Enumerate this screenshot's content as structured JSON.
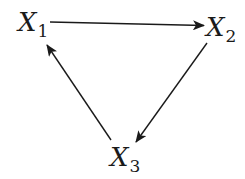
{
  "diagram": {
    "type": "directed-cycle",
    "stroke_color": "#1a1a1a",
    "nodes": [
      {
        "id": "X1",
        "letter": "X",
        "subscript": "1"
      },
      {
        "id": "X2",
        "letter": "X",
        "subscript": "2"
      },
      {
        "id": "X3",
        "letter": "X",
        "subscript": "3"
      }
    ],
    "edges": [
      {
        "from": "X1",
        "to": "X2"
      },
      {
        "from": "X2",
        "to": "X3"
      },
      {
        "from": "X3",
        "to": "X1"
      }
    ]
  }
}
